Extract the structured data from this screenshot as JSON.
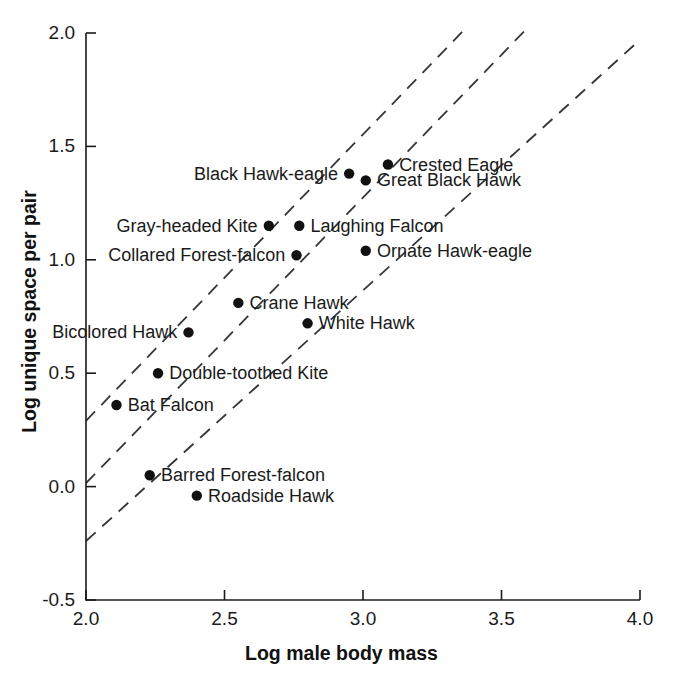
{
  "chart_data": {
    "type": "scatter",
    "title": "",
    "xlabel": "Log male body mass",
    "ylabel": "Log unique space per pair",
    "xlim": [
      2.0,
      4.0
    ],
    "ylim": [
      -0.5,
      2.0
    ],
    "xticks": [
      "2.0",
      "2.5",
      "3.0",
      "3.5",
      "4.0"
    ],
    "xtick_values": [
      2.0,
      2.5,
      3.0,
      3.5,
      4.0
    ],
    "yticks": [
      "2.0",
      "1.5",
      "1.0",
      "0.5",
      "0.0",
      "-0.5"
    ],
    "ytick_values": [
      2.0,
      1.5,
      1.0,
      0.5,
      0.0,
      -0.5
    ],
    "grid": false,
    "legend": "none",
    "marker_color": "#111111",
    "line_color": "#33363b",
    "line_style": "dashed",
    "points": [
      {
        "label": "Crested Eagle",
        "x": 3.09,
        "y": 1.42,
        "label_side": "right"
      },
      {
        "label": "Black Hawk-eagle",
        "x": 2.95,
        "y": 1.38,
        "label_side": "left"
      },
      {
        "label": "Great Black Hawk",
        "x": 3.01,
        "y": 1.35,
        "label_side": "right"
      },
      {
        "label": "Laughing Falcon",
        "x": 2.77,
        "y": 1.15,
        "label_side": "right"
      },
      {
        "label": "Gray-headed Kite",
        "x": 2.66,
        "y": 1.15,
        "label_side": "left"
      },
      {
        "label": "Ornate Hawk-eagle",
        "x": 3.01,
        "y": 1.04,
        "label_side": "right"
      },
      {
        "label": "Collared Forest-falcon",
        "x": 2.76,
        "y": 1.02,
        "label_side": "left"
      },
      {
        "label": "Crane Hawk",
        "x": 2.55,
        "y": 0.81,
        "label_side": "right"
      },
      {
        "label": "White Hawk",
        "x": 2.8,
        "y": 0.72,
        "label_side": "right"
      },
      {
        "label": "Bicolored Hawk",
        "x": 2.37,
        "y": 0.68,
        "label_side": "left"
      },
      {
        "label": "Double-toothed Kite",
        "x": 2.26,
        "y": 0.5,
        "label_side": "right"
      },
      {
        "label": "Bat Falcon",
        "x": 2.11,
        "y": 0.36,
        "label_side": "right"
      },
      {
        "label": "Barred Forest-falcon",
        "x": 2.23,
        "y": 0.05,
        "label_side": "right"
      },
      {
        "label": "Roadside Hawk",
        "x": 2.4,
        "y": -0.04,
        "label_side": "right"
      }
    ],
    "trend_lines": [
      {
        "name": "upper-trend-line",
        "x0": 2.0,
        "y0": 0.29,
        "x1": 3.37,
        "y1": 2.02
      },
      {
        "name": "middle-trend-line",
        "x0": 2.0,
        "y0": 0.015,
        "x1": 3.6,
        "y1": 2.03
      },
      {
        "name": "lower-trend-line",
        "x0": 2.0,
        "y0": -0.24,
        "x1": 4.0,
        "y1": 1.97
      }
    ]
  }
}
